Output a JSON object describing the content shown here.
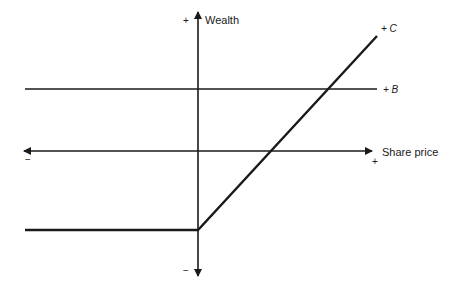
{
  "diagram": {
    "type": "payoff diagram",
    "axes": {
      "y_label": "Wealth",
      "y_positive_sign": "+",
      "y_negative_sign": "−",
      "x_label": "Share price",
      "x_positive_sign": "+",
      "x_negative_sign": "−"
    },
    "lines": [
      {
        "id": "B",
        "label": "+ B",
        "description": "horizontal line above the share price axis"
      },
      {
        "id": "C",
        "label": "+ C",
        "description": "flat below axis for negative share price, then rising diagonally from the origin region"
      }
    ],
    "colors": {
      "line": "#1a1a1a",
      "background": "#ffffff"
    }
  }
}
